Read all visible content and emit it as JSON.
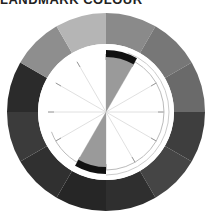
{
  "title": "LANDMARK COLOUR",
  "wheel": {
    "center": [
      106,
      112
    ],
    "outer_radius": 99,
    "inner_radius": 68,
    "segments": [
      {
        "start": 0,
        "color": "#8a8a8a"
      },
      {
        "start": 30,
        "color": "#777777"
      },
      {
        "start": 60,
        "color": "#6a6a6a"
      },
      {
        "start": 90,
        "color": "#3e3e3e"
      },
      {
        "start": 120,
        "color": "#454545"
      },
      {
        "start": 150,
        "color": "#2f2f2f"
      },
      {
        "start": 180,
        "color": "#262626"
      },
      {
        "start": 210,
        "color": "#303030"
      },
      {
        "start": 240,
        "color": "#3b3b3b"
      },
      {
        "start": 270,
        "color": "#2b2b2b"
      },
      {
        "start": 300,
        "color": "#8e8e8e"
      },
      {
        "start": 330,
        "color": "#b5b5b5"
      }
    ],
    "highlight_wedges": [
      {
        "start": 0,
        "end": 30,
        "color": "#9a9a9a",
        "arc_color": "#111111"
      },
      {
        "start": 180,
        "end": 210,
        "color": "#9a9a9a",
        "arc_color": "#111111"
      }
    ]
  }
}
